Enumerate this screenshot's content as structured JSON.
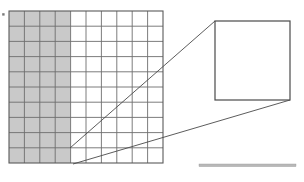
{
  "figure": {
    "title": "",
    "caption": "",
    "background_color": "#ffffff"
  },
  "colors": {
    "shaded_fill": "#c9c9c9",
    "unshaded_fill": "#ffffff",
    "grid_line": "#6e6e6e",
    "grid_border": "#5a5a5a",
    "callout_line": "#4a4a4a",
    "inset_stripe_dark": "#bdbdbd",
    "inset_stripe_light": "#ffffff",
    "scale_bar": "#b8b8b8",
    "marker_dot": "#7a7a7a"
  },
  "main_grid": {
    "label": "main-lattice-grid",
    "columns": 10,
    "rows": 10,
    "x": 9,
    "y": 11,
    "width": 154,
    "height": 152,
    "shaded_columns": 4,
    "shaded_region_label": "shaded-left-columns",
    "shaded_description": "left four columns filled gray",
    "unshaded_description": "right six columns empty white"
  },
  "marker": {
    "label": "left-edge-dot",
    "x": 3,
    "y": 14,
    "size": 2.2
  },
  "callout": {
    "label": "magnification-callout",
    "source_top": {
      "x": 70,
      "y": 148
    },
    "source_bottom": {
      "x": 73,
      "y": 164
    },
    "target_top": {
      "x": 215,
      "y": 21
    },
    "target_bottom": {
      "x": 290,
      "y": 100
    },
    "line_count": 2
  },
  "inset": {
    "label": "magnified-detail-inset",
    "x": 215,
    "y": 21,
    "width": 75,
    "height": 79,
    "stripe_count": 10,
    "shaded_stripes": 8,
    "blank_stripes": 2,
    "stripe_orientation": "vertical",
    "description": "magnified view showing vertical lamellae"
  },
  "scale_bar": {
    "label": "scale-bar",
    "x": 199,
    "y": 164,
    "width": 97,
    "height": 2.6,
    "text": ""
  }
}
